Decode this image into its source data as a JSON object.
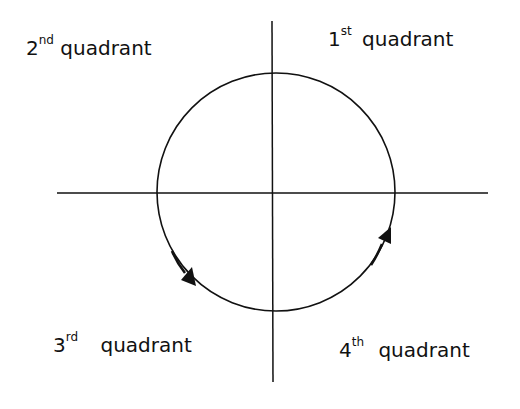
{
  "diagram": {
    "colors": {
      "stroke": "#111111",
      "background": "#ffffff",
      "text": "#111111"
    },
    "axes": {
      "horizontal": {
        "x1": 57,
        "x2": 488,
        "y": 193
      },
      "vertical": {
        "x": 272,
        "y1": 21,
        "y2": 382
      }
    },
    "circle": {
      "cx": 276,
      "cy": 192,
      "r": 119
    },
    "arrows": [
      {
        "name": "arrow-third-quadrant",
        "x": 188,
        "y": 278,
        "direction": "down-right"
      },
      {
        "name": "arrow-fourth-quadrant",
        "x": 386,
        "y": 236,
        "direction": "up"
      }
    ],
    "labels": {
      "q2": {
        "number": "2",
        "suffix": "nd",
        "word": "quadrant"
      },
      "q1": {
        "number": "1",
        "suffix": "st",
        "word": "quadrant"
      },
      "q3": {
        "number": "3",
        "suffix": "rd",
        "word": "quadrant"
      },
      "q4": {
        "number": "4",
        "suffix": "th",
        "word": "quadrant"
      }
    }
  }
}
